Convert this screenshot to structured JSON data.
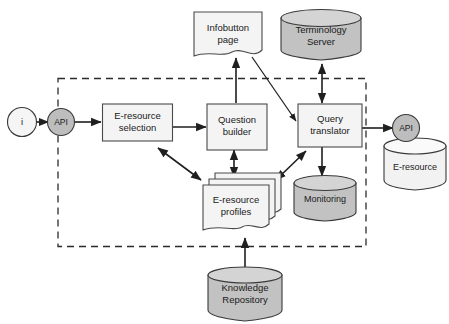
{
  "diagram": {
    "background_color": "#ffffff",
    "boundary": {
      "name": "system-boundary",
      "style": "dashed rectangle",
      "color": "#2b2b2b"
    },
    "nodes": [
      {
        "id": "user",
        "label": "i",
        "shape": "circle",
        "fill": "#f5f5f5"
      },
      {
        "id": "api-in",
        "label": "API",
        "shape": "circle",
        "fill": "#bdbdbd"
      },
      {
        "id": "eresource-selection",
        "label_line1": "E-resource",
        "label_line2": "selection",
        "shape": "rectangle",
        "fill": "#f4f4f4"
      },
      {
        "id": "question-builder",
        "label_line1": "Question",
        "label_line2": "builder",
        "shape": "rectangle",
        "fill": "#f4f4f4"
      },
      {
        "id": "query-translator",
        "label_line1": "Query",
        "label_line2": "translator",
        "shape": "rectangle",
        "fill": "#f4f4f4"
      },
      {
        "id": "infobutton-page",
        "label_line1": "Infobutton",
        "label_line2": "page",
        "shape": "document",
        "fill": "#f4f4f4"
      },
      {
        "id": "terminology-server",
        "label_line1": "Terminology",
        "label_line2": "Server",
        "shape": "cylinder",
        "fill": "#c2c2c2"
      },
      {
        "id": "eresource-profiles",
        "label_line1": "E-resource",
        "label_line2": "profiles",
        "shape": "multi-document",
        "fill": "#f4f4f4"
      },
      {
        "id": "monitoring",
        "label": "Monitoring",
        "shape": "cylinder",
        "fill": "#c2c2c2"
      },
      {
        "id": "knowledge-repository",
        "label_line1": "Knowledge",
        "label_line2": "Repository",
        "shape": "cylinder",
        "fill": "#c2c2c2"
      },
      {
        "id": "api-out",
        "label": "API",
        "shape": "circle",
        "fill": "#bdbdbd"
      },
      {
        "id": "eresource-db",
        "label": "E-resource",
        "shape": "cylinder",
        "fill": "#f2f2f2"
      }
    ],
    "edges": [
      {
        "from": "user",
        "to": "api-in",
        "type": "arrow"
      },
      {
        "from": "api-in",
        "to": "eresource-selection",
        "type": "arrow"
      },
      {
        "from": "eresource-selection",
        "to": "question-builder",
        "type": "arrow"
      },
      {
        "from": "question-builder",
        "to": "infobutton-page",
        "type": "arrow"
      },
      {
        "from": "infobutton-page",
        "to": "query-translator",
        "type": "arrow"
      },
      {
        "from": "query-translator",
        "to": "terminology-server",
        "type": "double-arrow"
      },
      {
        "from": "eresource-selection",
        "to": "eresource-profiles",
        "type": "double-arrow"
      },
      {
        "from": "question-builder",
        "to": "eresource-profiles",
        "type": "double-arrow"
      },
      {
        "from": "query-translator",
        "to": "eresource-profiles",
        "type": "double-arrow"
      },
      {
        "from": "query-translator",
        "to": "monitoring",
        "type": "arrow"
      },
      {
        "from": "knowledge-repository",
        "to": "eresource-profiles",
        "type": "arrow"
      },
      {
        "from": "query-translator",
        "to": "api-out",
        "type": "arrow"
      }
    ]
  }
}
